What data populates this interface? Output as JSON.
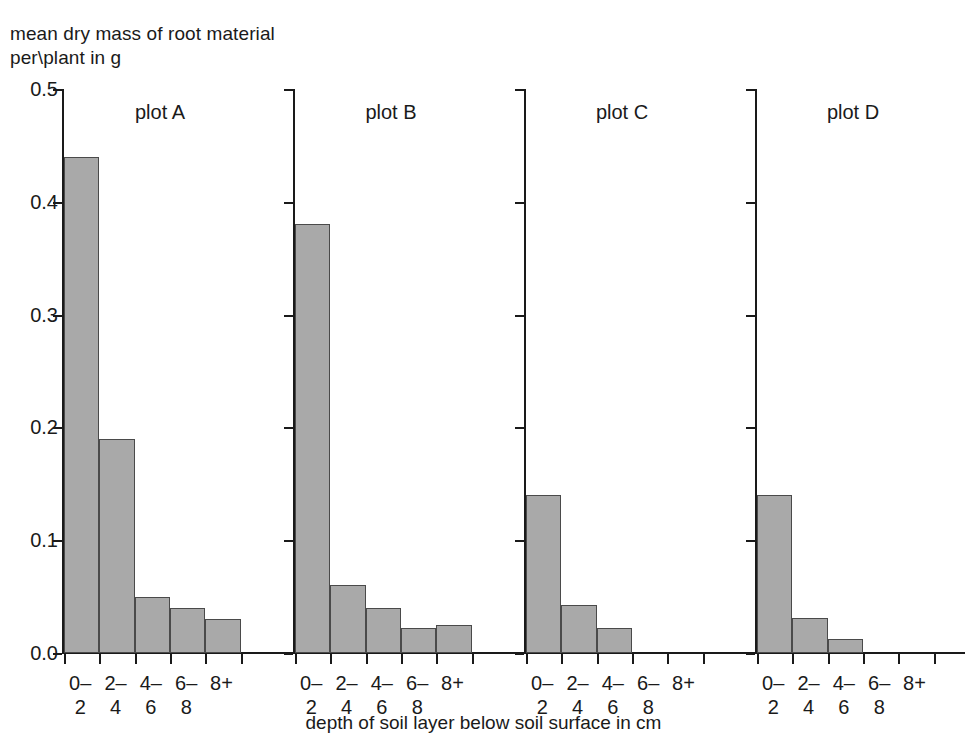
{
  "chart_data": {
    "type": "bar",
    "title": "",
    "ylabel": "mean dry mass of root material per\\plant in g",
    "xlabel": "depth of soil layer below soil surface in cm",
    "categories": [
      "0–\n2",
      "2–\n4",
      "4–\n6",
      "6–\n8",
      "8+"
    ],
    "category_values": [
      "0-2",
      "2-4",
      "4-6",
      "6-8",
      "8+"
    ],
    "ylim": [
      0.0,
      0.5
    ],
    "ytick_labels": [
      "0.0",
      "0.1",
      "0.2",
      "0.3",
      "0.4",
      "0.5"
    ],
    "ytick_values": [
      0.0,
      0.1,
      0.2,
      0.3,
      0.4,
      0.5
    ],
    "grid": false,
    "legend": "none",
    "panels": [
      {
        "name": "plot A",
        "values": [
          0.44,
          0.19,
          0.05,
          0.04,
          0.03
        ]
      },
      {
        "name": "plot B",
        "values": [
          0.38,
          0.06,
          0.04,
          0.022,
          0.025
        ]
      },
      {
        "name": "plot C",
        "values": [
          0.14,
          0.043,
          0.022,
          0.0,
          0.0
        ]
      },
      {
        "name": "plot D",
        "values": [
          0.14,
          0.031,
          0.012,
          0.0,
          0.0
        ]
      }
    ],
    "series": [
      {
        "name": "plot A",
        "values": [
          0.44,
          0.19,
          0.05,
          0.04,
          0.03
        ]
      },
      {
        "name": "plot B",
        "values": [
          0.38,
          0.06,
          0.04,
          0.022,
          0.025
        ]
      },
      {
        "name": "plot C",
        "values": [
          0.14,
          0.043,
          0.022,
          0.0,
          0.0
        ]
      },
      {
        "name": "plot D",
        "values": [
          0.14,
          0.031,
          0.012,
          0.0,
          0.0
        ]
      }
    ],
    "colors": {
      "bar_fill": "#a9a9a9",
      "bar_edge": "#4a4a4a",
      "axis": "#1a1a1a",
      "background": "#ffffff"
    }
  },
  "axis": {
    "y_title_line1": "mean dry mass of root material",
    "y_title_line2": "per\\plant in g",
    "x_title": "depth of soil layer below soil surface in cm"
  }
}
